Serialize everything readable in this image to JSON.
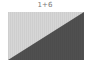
{
  "tile": {
    "label": "1+6",
    "colors": {
      "light": "#d6d6d6",
      "dark": "#505050",
      "label": "#777777"
    }
  }
}
